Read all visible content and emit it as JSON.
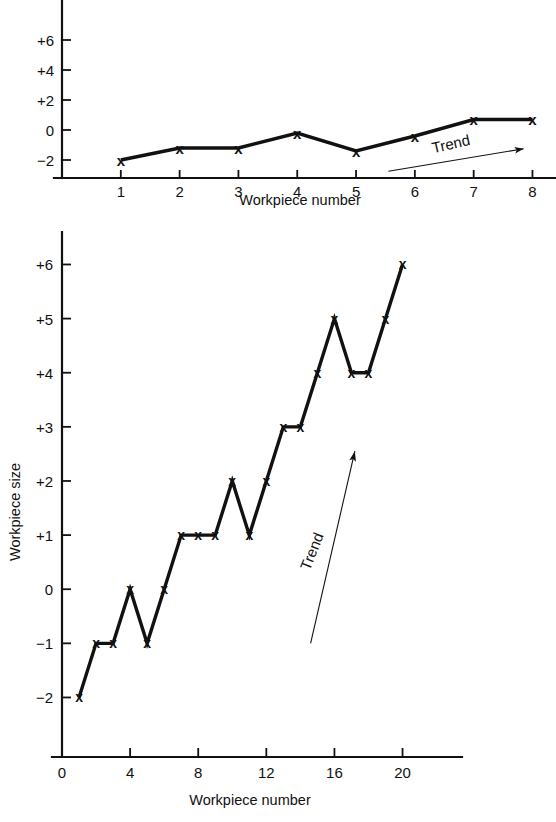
{
  "page": {
    "background_color": "#ffffff",
    "ink_color": "#111111",
    "width": 556,
    "height": 822
  },
  "chart_data": [
    {
      "id": "top-chart",
      "type": "line",
      "title": "",
      "xlabel": "Workpiece number",
      "ylabel": "",
      "x": [
        1,
        2,
        3,
        4,
        5,
        6,
        7,
        8
      ],
      "values": [
        -2.0,
        -1.2,
        -1.2,
        -0.2,
        -1.4,
        -0.4,
        0.7,
        0.7
      ],
      "marker": "x",
      "xlim": [
        0.0,
        8.4
      ],
      "ylim": [
        -3.2,
        7.2
      ],
      "xticks": [
        1,
        2,
        3,
        4,
        5,
        6,
        7,
        8
      ],
      "xticklabels": [
        "1",
        "2",
        "3",
        "4",
        "5",
        "6",
        "7",
        "8"
      ],
      "yticks": [
        -2,
        0,
        2,
        4,
        6
      ],
      "yticklabels": [
        "−2",
        "0",
        "+2",
        "+4",
        "+6"
      ],
      "grid": false,
      "legend": "none",
      "annotations": [
        {
          "text": "Trend",
          "kind": "trend-arrow",
          "rotation_deg": -13,
          "x_start": 5.55,
          "y_start": -2.75,
          "x_end": 7.85,
          "y_end": -1.25
        }
      ]
    },
    {
      "id": "bottom-chart",
      "type": "line",
      "title": "",
      "xlabel": "Workpiece number",
      "ylabel": "Workpiece size",
      "x": [
        1,
        2,
        3,
        4,
        5,
        6,
        7,
        8,
        9,
        10,
        11,
        12,
        13,
        14,
        15,
        16,
        17,
        18,
        19,
        20
      ],
      "values": [
        -2,
        -1,
        -1,
        0,
        -1,
        0,
        1,
        1,
        1,
        2,
        1,
        2,
        3,
        3,
        4,
        5,
        4,
        4,
        5,
        6
      ],
      "marker": "x",
      "xlim": [
        0,
        22.2
      ],
      "ylim": [
        -3.1,
        6.6
      ],
      "xticks": [
        0,
        4,
        8,
        12,
        16,
        20
      ],
      "xticklabels": [
        "0",
        "4",
        "8",
        "12",
        "16",
        "20"
      ],
      "yticks": [
        -2,
        -1,
        0,
        1,
        2,
        3,
        4,
        5,
        6
      ],
      "yticklabels": [
        "−2",
        "−1",
        "0",
        "+1",
        "+2",
        "+3",
        "+4",
        "+5",
        "+6"
      ],
      "grid": false,
      "legend": "none",
      "annotations": [
        {
          "text": "Trend",
          "kind": "trend-arrow",
          "rotation_deg": -68,
          "x_start": 14.6,
          "y_start": -1.0,
          "x_end": 17.2,
          "y_end": 2.55
        }
      ]
    }
  ]
}
